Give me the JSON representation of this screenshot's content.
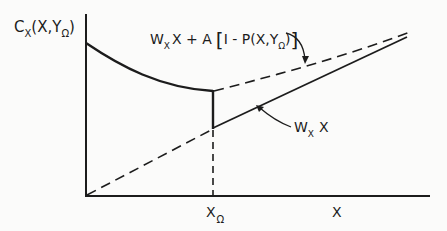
{
  "figure": {
    "y_axis_label": {
      "main": "C",
      "main_sub": "X",
      "args_open": "(X,Y",
      "args_sub": "Ω",
      "args_close": ")"
    },
    "x_axis_label": "X",
    "x_tick_label": {
      "main": "X",
      "sub": "Ω"
    },
    "upper_curve_label": {
      "w": "W",
      "w_sub": "X",
      "rest": "X + A",
      "bracket_open": "[",
      "inner": "I - P(X,Y",
      "inner_sub": "Ω",
      "inner_close": ")",
      "bracket_close": "]"
    },
    "lower_line_label": {
      "w": "W",
      "w_sub": "X",
      "rest": "X"
    },
    "colors": {
      "ink": "#1c1c1c",
      "background": "#fbfbfa"
    }
  }
}
